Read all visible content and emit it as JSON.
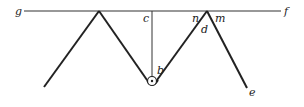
{
  "diagram": {
    "labels": {
      "g": "g",
      "f": "f",
      "c": "c",
      "n": "n",
      "m": "m",
      "d": "d",
      "b": "b",
      "e": "e"
    },
    "colors": {
      "stroke": "#222222",
      "background": "#ffffff"
    }
  }
}
